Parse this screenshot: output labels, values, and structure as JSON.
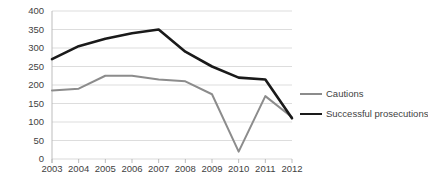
{
  "chart_data": {
    "type": "line",
    "title": "",
    "xlabel": "",
    "ylabel": "",
    "categories": [
      "2003",
      "2004",
      "2005",
      "2006",
      "2007",
      "2008",
      "2009",
      "2010",
      "2011",
      "2012"
    ],
    "series": [
      {
        "name": "Cautions",
        "color": "#8c8c8c",
        "values": [
          185,
          190,
          225,
          225,
          215,
          210,
          175,
          20,
          170,
          113
        ]
      },
      {
        "name": "Successful prosecutions",
        "color": "#1a1a1a",
        "values": [
          270,
          305,
          325,
          340,
          350,
          290,
          250,
          220,
          215,
          110
        ]
      }
    ],
    "ylim": [
      0,
      400
    ],
    "ytick_step": 50,
    "yticks": [
      "400",
      "350",
      "300",
      "250",
      "200",
      "150",
      "100",
      "50",
      "0"
    ],
    "grid": true,
    "grid_color": "#d9d9d9",
    "legend_position": "right",
    "background": "#ffffff"
  }
}
